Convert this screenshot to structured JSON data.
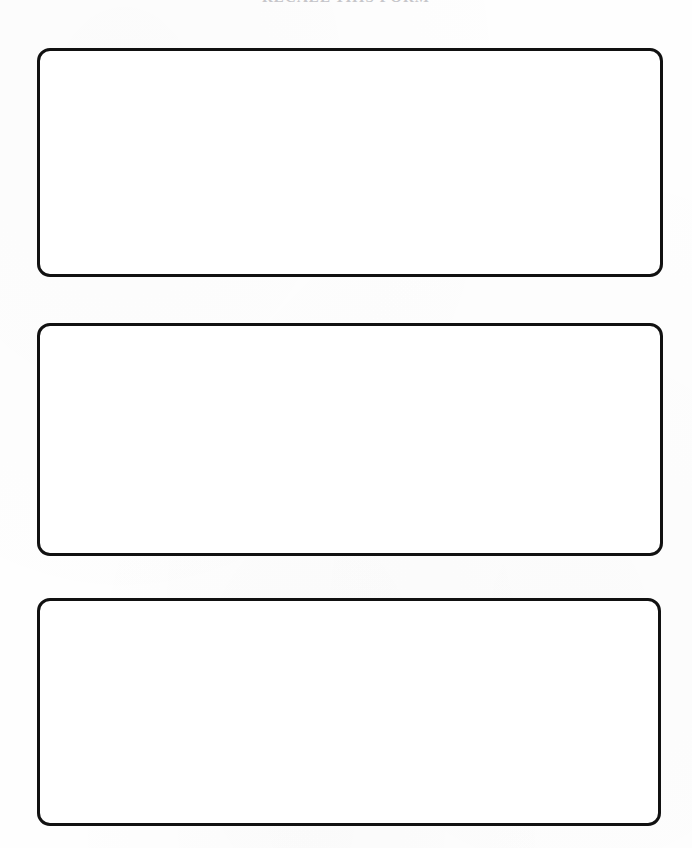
{
  "page": {
    "width": 692,
    "height": 848,
    "background_color": "#fefefe",
    "document_type": "scanned blank worksheet"
  },
  "heading": {
    "text": "RECALL THIS FORM",
    "note_visible": "cropped at top edge of page; only faint lower pixel fragments of the letters are rendered",
    "color": "#9a9aa2",
    "align": "center"
  },
  "boxes": [
    {
      "label": "answer-box-1",
      "content": "",
      "placeholder": "",
      "border_color": "#111111",
      "border_width": "3px",
      "corner_radius": "13px",
      "fill_color": "#ffffff"
    },
    {
      "label": "answer-box-2",
      "content": "",
      "placeholder": "",
      "border_color": "#111111",
      "border_width": "3px",
      "corner_radius": "13px",
      "fill_color": "#ffffff"
    },
    {
      "label": "answer-box-3",
      "content": "",
      "placeholder": "",
      "border_color": "#111111",
      "border_width": "3px",
      "corner_radius": "13px",
      "fill_color": "#ffffff"
    }
  ]
}
